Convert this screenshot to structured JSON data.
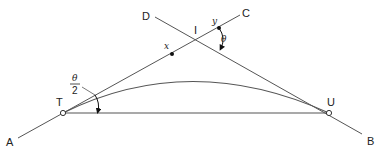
{
  "diagram": {
    "colors": {
      "line": "#555555",
      "text": "#222222",
      "point_fill": "#ffffff",
      "dot": "#111111"
    },
    "labels": {
      "A": "A",
      "B": "B",
      "C": "C",
      "D": "D",
      "I": "I",
      "T": "T",
      "U": "U",
      "x": "x",
      "y": "y",
      "theta": "θ",
      "half_theta_num": "θ",
      "half_theta_den": "2"
    },
    "points": {
      "A": [
        18,
        138
      ],
      "B": [
        362,
        134
      ],
      "C": [
        240,
        15
      ],
      "D": [
        155,
        17
      ],
      "I": [
        212,
        41
      ],
      "T": [
        63,
        113
      ],
      "U": [
        329,
        113
      ],
      "x": [
        172,
        54
      ],
      "y": [
        219,
        28
      ]
    }
  }
}
